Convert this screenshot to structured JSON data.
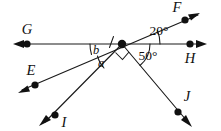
{
  "figure": {
    "type": "geometry-diagram",
    "width": 221,
    "height": 131,
    "background_color": "#ffffff",
    "stroke_color": "#1a1a1a"
  },
  "vertex": {
    "name": "intersection-point",
    "x": 122,
    "y": 44
  },
  "points": [
    {
      "id": "F",
      "label": "F",
      "dot_x": 185,
      "dot_y": 20,
      "label_x": 177,
      "label_y": 8,
      "arrow_angle_deg": -21
    },
    {
      "id": "G",
      "label": "G",
      "dot_x": 27,
      "dot_y": 44,
      "label_x": 27,
      "label_y": 31,
      "arrow_angle_deg": 180
    },
    {
      "id": "H",
      "label": "H",
      "dot_x": 190,
      "dot_y": 44,
      "label_x": 190,
      "label_y": 59,
      "arrow_angle_deg": 0
    },
    {
      "id": "E",
      "label": "E",
      "dot_x": 35,
      "dot_y": 85,
      "label_x": 31,
      "label_y": 72,
      "arrow_angle_deg": 159
    },
    {
      "id": "I",
      "label": "I",
      "dot_x": 55,
      "dot_y": 115,
      "label_x": 63,
      "label_y": 124,
      "arrow_angle_deg": 131
    },
    {
      "id": "J",
      "label": "J",
      "dot_x": 178,
      "dot_y": 112,
      "label_x": 186,
      "label_y": 98,
      "arrow_angle_deg": 57
    }
  ],
  "lines": [
    {
      "name": "line-GH",
      "from": "G",
      "to": "H",
      "through_vertex": true,
      "description": "horizontal line through vertex"
    },
    {
      "name": "line-EF",
      "from": "E",
      "to": "F",
      "through_vertex": true,
      "description": "transversal line making 20 degrees with GH"
    },
    {
      "name": "ray-to-I",
      "from": "vertex",
      "to": "I",
      "through_vertex": false,
      "description": "ray going down-left"
    },
    {
      "name": "ray-to-J",
      "from": "vertex",
      "to": "J",
      "through_vertex": false,
      "description": "ray going down-right at 50 degrees below GH"
    }
  ],
  "angles": [
    {
      "id": "angle-20",
      "label": "20°",
      "value": 20,
      "unit": "degrees",
      "label_x": 159,
      "label_y": 32,
      "between": [
        "ray-to-F",
        "ray-to-H"
      ],
      "has_arc": true
    },
    {
      "id": "angle-50",
      "label": "50°",
      "value": 50,
      "unit": "degrees",
      "label_x": 147,
      "label_y": 57,
      "between": [
        "ray-to-H",
        "ray-to-J"
      ],
      "has_arc": true
    },
    {
      "id": "angle-b",
      "label": "b",
      "value": null,
      "unit": "variable",
      "label_x": 96,
      "label_y": 51,
      "between": [
        "ray-to-G",
        "ray-to-E"
      ],
      "has_arc": true,
      "has_tick": true
    },
    {
      "id": "angle-a",
      "label": "a",
      "value": null,
      "unit": "variable",
      "label_x": 101,
      "label_y": 63,
      "between": [
        "ray-to-E",
        "ray-to-I"
      ],
      "has_arc": true
    },
    {
      "id": "right-angle-IJ",
      "label": "",
      "value": 90,
      "unit": "degrees",
      "label_x": 0,
      "label_y": 0,
      "between": [
        "ray-to-I",
        "ray-to-J"
      ],
      "has_arc": false,
      "is_right_angle_marker": true
    }
  ]
}
